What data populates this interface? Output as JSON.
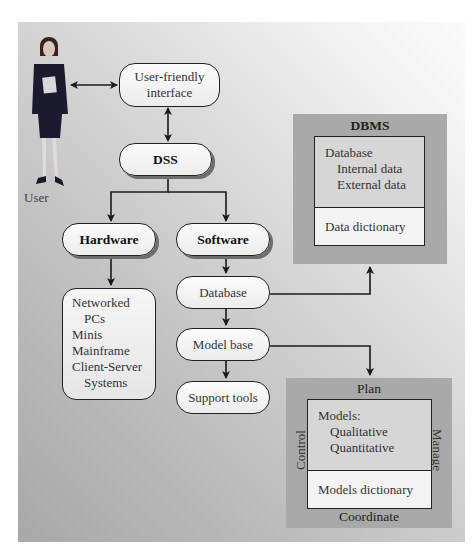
{
  "diagram": {
    "user": {
      "label": "User",
      "icon": "businesswoman-figure"
    },
    "interface": {
      "line1": "User-friendly",
      "line2": "interface"
    },
    "dss": {
      "label": "DSS"
    },
    "hardware": {
      "label": "Hardware",
      "items": [
        "Networked",
        "PCs",
        "Minis",
        "Mainframe",
        "Client-Server",
        "Systems"
      ]
    },
    "software": {
      "label": "Software",
      "components": {
        "database": "Database",
        "model_base": "Model base",
        "support_tools": "Support tools"
      }
    },
    "dbms": {
      "title": "DBMS",
      "database_heading": "Database",
      "database_items": [
        "Internal data",
        "External data"
      ],
      "dictionary": "Data dictionary"
    },
    "mbms": {
      "top_label": "Plan",
      "bottom_label": "Coordinate",
      "left_label": "Control",
      "right_label": "Manage",
      "models_heading": "Models:",
      "models_items": [
        "Qualitative",
        "Quantitative"
      ],
      "dictionary": "Models dictionary"
    },
    "colors": {
      "line": "#222222",
      "panel_dark": "#a8a8a8",
      "panel_light": "#fafafa",
      "frame": "#a9a9a9"
    }
  }
}
